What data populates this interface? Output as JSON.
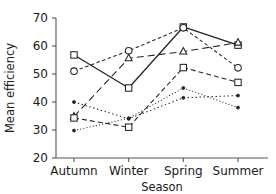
{
  "chart_data": {
    "type": "line",
    "title": "",
    "subtitle": "",
    "xlabel": "Season",
    "ylabel": "Mean efficiency",
    "categories": [
      "Autumn",
      "Winter",
      "Spring",
      "Summer"
    ],
    "xlim": [
      0,
      3
    ],
    "ylim": [
      20,
      70
    ],
    "yticks": [
      20,
      30,
      40,
      50,
      60,
      70
    ],
    "ytick_labels": [
      "20",
      "30",
      "40",
      "50",
      "60",
      "70"
    ],
    "grid": false,
    "legend": "none",
    "legend_position": "none",
    "annotations": [],
    "colors": {
      "axis": "#555555",
      "line": "#222222",
      "marker_face": "#ffffff",
      "marker_edge": "#222222"
    },
    "series": [
      {
        "name": "series-1",
        "marker": "square",
        "linestyle": "solid",
        "values": [
          56.8,
          45.0,
          66.8,
          60.3
        ]
      },
      {
        "name": "series-2",
        "marker": "circle",
        "linestyle": "dashed-short",
        "values": [
          51.0,
          58.3,
          66.5,
          52.2
        ]
      },
      {
        "name": "series-3",
        "marker": "triangle",
        "linestyle": "dashed-long",
        "values": [
          34.8,
          55.6,
          58.0,
          61.2
        ]
      },
      {
        "name": "series-4",
        "marker": "square",
        "linestyle": "dashed-medium",
        "values": [
          34.3,
          31.0,
          52.3,
          47.0
        ]
      },
      {
        "name": "series-5",
        "marker": "dot",
        "linestyle": "dotted",
        "values": [
          40.0,
          34.0,
          41.5,
          42.3
        ]
      },
      {
        "name": "series-6",
        "marker": "dot",
        "linestyle": "dotted-fine",
        "values": [
          29.8,
          34.2,
          45.0,
          38.0
        ]
      }
    ]
  }
}
